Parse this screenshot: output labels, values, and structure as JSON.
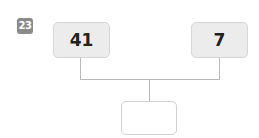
{
  "problem": {
    "number": "23",
    "left_value": "41",
    "right_value": "7",
    "answer_value": ""
  }
}
